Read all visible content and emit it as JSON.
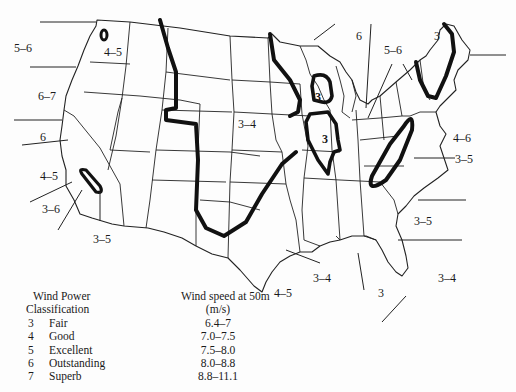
{
  "map": {
    "subject": "United States wind resource map (wind power classes at 50 m)",
    "region_labels": [
      {
        "id": "pacific-nw-offshore",
        "text": "5–6",
        "x": 14,
        "y": 42
      },
      {
        "id": "puget-sound",
        "text": "4–5",
        "x": 104,
        "y": 46
      },
      {
        "id": "oregon-offshore",
        "text": "6–7",
        "x": 38,
        "y": 90
      },
      {
        "id": "n-california-offshore",
        "text": "6",
        "x": 40,
        "y": 131
      },
      {
        "id": "central-california-offshore",
        "text": "4–5",
        "x": 40,
        "y": 170
      },
      {
        "id": "s-california-offshore",
        "text": "3–6",
        "x": 42,
        "y": 203
      },
      {
        "id": "s-california-inland",
        "text": "3–5",
        "x": 93,
        "y": 233
      },
      {
        "id": "great-plains",
        "text": "3–4",
        "x": 238,
        "y": 118
      },
      {
        "id": "lake-superior",
        "text": "6",
        "x": 356,
        "y": 30
      },
      {
        "id": "great-lakes-east",
        "text": "5–6",
        "x": 384,
        "y": 44
      },
      {
        "id": "new-england",
        "text": "3",
        "x": 434,
        "y": 30
      },
      {
        "id": "wisconsin-michigan",
        "text": "3",
        "x": 315,
        "y": 91
      },
      {
        "id": "illinois",
        "text": "3",
        "x": 322,
        "y": 133
      },
      {
        "id": "mid-atlantic-offshore",
        "text": "4–6",
        "x": 453,
        "y": 132
      },
      {
        "id": "appalachian",
        "text": "3–5",
        "x": 455,
        "y": 153
      },
      {
        "id": "carolinas-offshore",
        "text": "3–5",
        "x": 414,
        "y": 215
      },
      {
        "id": "gulf-louisiana",
        "text": "3–4",
        "x": 313,
        "y": 272
      },
      {
        "id": "gulf-texas",
        "text": "4–5",
        "x": 274,
        "y": 287
      },
      {
        "id": "gulf-florida",
        "text": "3",
        "x": 378,
        "y": 287
      },
      {
        "id": "atlantic-florida",
        "text": "3–4",
        "x": 438,
        "y": 272
      }
    ]
  },
  "legend": {
    "header_class_line1": "Wind Power",
    "header_class_line2": "Classification",
    "header_speed_line1": "Wind speed at 50m",
    "header_speed_line2": "(m/s)",
    "rows": [
      {
        "class": "3",
        "name": "Fair",
        "speed": "6.4–7"
      },
      {
        "class": "4",
        "name": "Good",
        "speed": "7.0–7.5"
      },
      {
        "class": "5",
        "name": "Excellent",
        "speed": "7.5–8.0"
      },
      {
        "class": "6",
        "name": "Outstanding",
        "speed": "8.0–8.8"
      },
      {
        "class": "7",
        "name": "Superb",
        "speed": "8.8–11.1"
      }
    ]
  }
}
